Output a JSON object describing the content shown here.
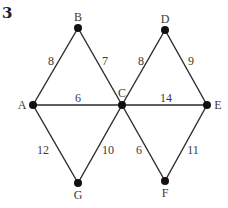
{
  "problem_number": "3",
  "graph": {
    "nodes": [
      {
        "id": "A",
        "label": "A",
        "x": 33,
        "y": 105,
        "lx": 22,
        "ly": 109,
        "anchor": "middle"
      },
      {
        "id": "B",
        "label": "B",
        "x": 78,
        "y": 28,
        "lx": 78,
        "ly": 21,
        "anchor": "middle"
      },
      {
        "id": "C",
        "label": "C",
        "x": 122,
        "y": 105,
        "lx": 122,
        "ly": 97,
        "anchor": "middle"
      },
      {
        "id": "D",
        "label": "D",
        "x": 165,
        "y": 30,
        "lx": 165,
        "ly": 23,
        "anchor": "middle"
      },
      {
        "id": "E",
        "label": "E",
        "x": 207,
        "y": 105,
        "lx": 218,
        "ly": 109,
        "anchor": "middle"
      },
      {
        "id": "F",
        "label": "F",
        "x": 165,
        "y": 181,
        "lx": 165,
        "ly": 197,
        "anchor": "middle"
      },
      {
        "id": "G",
        "label": "G",
        "x": 78,
        "y": 183,
        "lx": 78,
        "ly": 199,
        "anchor": "middle"
      }
    ],
    "edges": [
      {
        "from": "A",
        "to": "B",
        "weight": "8",
        "lx": 51,
        "ly": 65
      },
      {
        "from": "B",
        "to": "C",
        "weight": "7",
        "lx": 105,
        "ly": 65
      },
      {
        "from": "A",
        "to": "C",
        "weight": "6",
        "lx": 78,
        "ly": 102
      },
      {
        "from": "C",
        "to": "D",
        "weight": "8",
        "lx": 141,
        "ly": 65
      },
      {
        "from": "D",
        "to": "E",
        "weight": "9",
        "lx": 191,
        "ly": 65
      },
      {
        "from": "C",
        "to": "E",
        "weight": "14",
        "lx": 166,
        "ly": 102
      },
      {
        "from": "A",
        "to": "G",
        "weight": "12",
        "lx": 43,
        "ly": 154
      },
      {
        "from": "C",
        "to": "G",
        "weight": "10",
        "lx": 108,
        "ly": 154
      },
      {
        "from": "C",
        "to": "F",
        "weight": "6",
        "lx": 139,
        "ly": 154
      },
      {
        "from": "E",
        "to": "F",
        "weight": "11",
        "lx": 193,
        "ly": 154
      }
    ]
  }
}
